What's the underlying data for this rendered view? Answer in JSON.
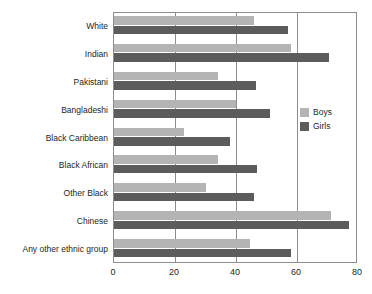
{
  "chart_data": {
    "type": "bar",
    "orientation": "horizontal",
    "title": "",
    "subtitle": "",
    "xlabel": "",
    "ylabel": "",
    "xlim": [
      0,
      80
    ],
    "xticks": [
      0,
      20,
      40,
      60,
      80
    ],
    "xtick_labels": [
      "0",
      "20",
      "40",
      "60",
      "80"
    ],
    "grid": "vertical",
    "legend_position": "right-middle",
    "categories": [
      "White",
      "Indian",
      "Pakistani",
      "Bangladeshi",
      "Black Caribbean",
      "Black African",
      "Other Black",
      "Chinese",
      "Any other ethnic group"
    ],
    "series": [
      {
        "name": "Boys",
        "color": "#b4b4b4",
        "values": [
          46,
          58,
          34,
          40,
          23,
          34,
          30,
          71,
          44.5
        ]
      },
      {
        "name": "Girls",
        "color": "#5c5c5c",
        "values": [
          57,
          70.5,
          46.5,
          51,
          38,
          47,
          46,
          77,
          58
        ]
      }
    ]
  },
  "legend": {
    "items": [
      {
        "label": "Boys",
        "color": "#b4b4b4"
      },
      {
        "label": "Girls",
        "color": "#5c5c5c"
      }
    ]
  },
  "colors": {
    "boys": "#b4b4b4",
    "girls": "#5c5c5c",
    "axis": "#8d8d8d",
    "text": "#231f20",
    "background": "#ffffff"
  }
}
